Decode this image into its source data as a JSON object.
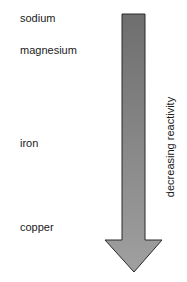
{
  "diagram": {
    "metals": [
      {
        "label": "sodium",
        "top": 12
      },
      {
        "label": "magnesium",
        "top": 44
      },
      {
        "label": "iron",
        "top": 137
      },
      {
        "label": "copper",
        "top": 221
      }
    ],
    "arrow": {
      "direction": "down",
      "label": "decreasing reactivity",
      "fill": "#8c8c8c",
      "stroke": "#2a2a2a"
    }
  }
}
